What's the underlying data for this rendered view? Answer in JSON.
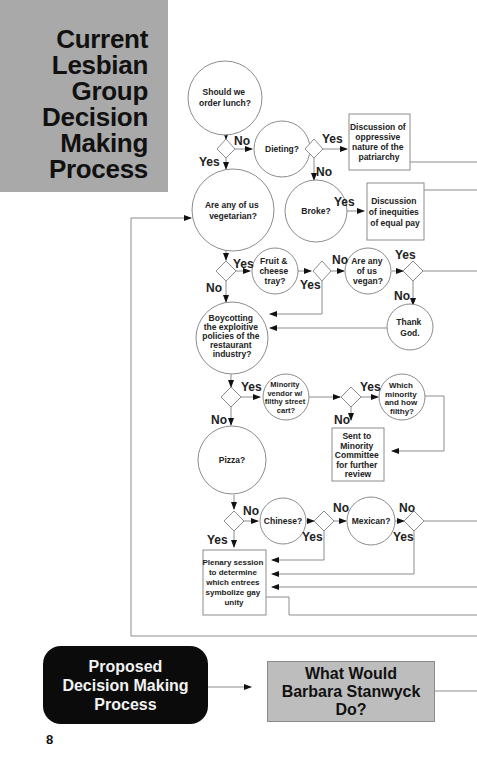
{
  "title": {
    "lines": [
      "Current",
      "Lesbian",
      "Group",
      "Decision",
      "Making",
      "Process"
    ]
  },
  "nodes": {
    "order_lunch": [
      "Should we",
      "order lunch?"
    ],
    "dieting": [
      "Dieting?"
    ],
    "patriarchy": [
      "Discussion of",
      "oppressive",
      "nature of the",
      "patriarchy"
    ],
    "broke": [
      "Broke?"
    ],
    "equal_pay": [
      "Discussion",
      "of inequities",
      "of equal pay"
    ],
    "vegetarian": [
      "Are any of us",
      "vegetarian?"
    ],
    "fruit_cheese": [
      "Fruit &",
      "cheese",
      "tray?"
    ],
    "vegan": [
      "Are any",
      "of us",
      "vegan?"
    ],
    "thank_god": [
      "Thank",
      "God."
    ],
    "boycotting": [
      "Boycotting",
      "the exploitive",
      "policies of the",
      "restaurant",
      "industry?"
    ],
    "minority_vendor": [
      "Minority",
      "vendor w/",
      "filthy street",
      "cart?"
    ],
    "which_minority": [
      "Which",
      "minority",
      "and how",
      "filthy?"
    ],
    "minority_committee": [
      "Sent to",
      "Minority",
      "Committee",
      "for further",
      "review"
    ],
    "pizza": [
      "Pizza?"
    ],
    "chinese": [
      "Chinese?"
    ],
    "mexican": [
      "Mexican?"
    ],
    "plenary": [
      "Plenary session",
      "to determine",
      "which entrees",
      "symbolize gay",
      "unity"
    ]
  },
  "edge_labels": {
    "lunch_no": "No",
    "lunch_yes": "Yes",
    "dieting_yes": "Yes",
    "dieting_no": "No",
    "broke_yes": "Yes",
    "veg_yes": "Yes",
    "veg_no": "No",
    "fruit_no": "No",
    "fruit_yes": "Yes",
    "vegan_yes": "Yes",
    "vegan_no": "No",
    "boycott_yes": "Yes",
    "boycott_no": "No",
    "vendor_yes": "Yes",
    "vendor_no": "No",
    "pizza_no": "No",
    "pizza_yes": "Yes",
    "chinese_no": "No",
    "chinese_yes": "Yes",
    "mexican_no": "No",
    "mexican_yes": "Yes"
  },
  "proposed": {
    "lines": [
      "Proposed",
      "Decision Making",
      "Process"
    ]
  },
  "stanwyck": {
    "lines": [
      "What Would",
      "Barbara Stanwyck",
      "Do?"
    ]
  },
  "page_number": "8",
  "colors": {
    "title_panel": "#a9a9a9",
    "proposed_bg": "#0b0b0b",
    "stanwyck_bg": "#bdbdbd",
    "line": "#8c8c8c"
  }
}
